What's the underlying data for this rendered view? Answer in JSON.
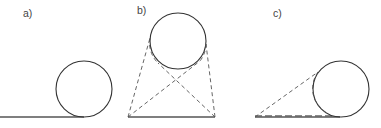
{
  "panels": [
    {
      "id": "a",
      "label": "a)",
      "description": "circle resting on a horizontal line"
    },
    {
      "id": "b",
      "label": "b)",
      "description": "circle above a base line with two crossed dashed tangent lines and two outer dashed tangent lines"
    },
    {
      "id": "c",
      "label": "c)",
      "description": "circle on a base line with a dashed tangent line from the left end of the base"
    }
  ],
  "colors": {
    "stroke": "#333333",
    "dash": "#555555",
    "background": "#ffffff"
  }
}
